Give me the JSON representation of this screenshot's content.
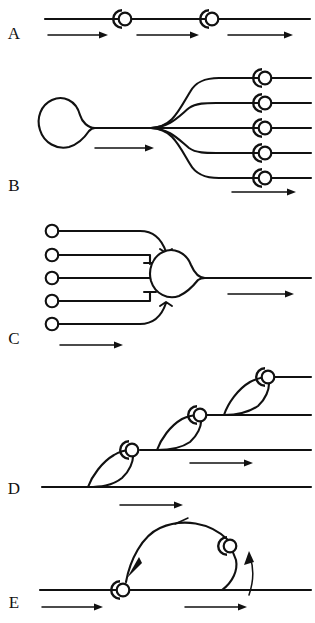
{
  "figure": {
    "title": "",
    "background_color": "#ffffff",
    "ink_color": "#111111",
    "width": 315,
    "height": 623,
    "panel_labels": [
      {
        "id": "A",
        "text": "A",
        "x": 14,
        "y": 39
      },
      {
        "id": "B",
        "text": "B",
        "x": 14,
        "y": 191
      },
      {
        "id": "C",
        "text": "C",
        "x": 14,
        "y": 344
      },
      {
        "id": "D",
        "text": "D",
        "x": 14,
        "y": 494
      },
      {
        "id": "E",
        "text": "E",
        "x": 14,
        "y": 608
      }
    ],
    "panels": [
      {
        "id": "A",
        "label": "A",
        "description": "straight axon with two en-passant node symbols and three rightward flow arrows",
        "baseline_y": 19,
        "axon": {
          "x_start": 45,
          "x_end": 310,
          "y": 19
        },
        "nodes": [
          {
            "cx": 125,
            "cy": 19,
            "r": 7.5
          },
          {
            "cx": 212,
            "cy": 19,
            "r": 7.5
          }
        ],
        "arrows": [
          {
            "x1": 48,
            "y": 35,
            "x2": 105
          },
          {
            "x1": 137,
            "y": 35,
            "x2": 196
          },
          {
            "x1": 228,
            "y": 35,
            "x2": 290
          }
        ]
      },
      {
        "id": "B",
        "label": "B",
        "description": "divergence: one soma tapering into a single axon that branches into five collaterals, each ending at a node symbol",
        "soma": {
          "cx": 70,
          "cy": 125,
          "r": 25
        },
        "trunk": {
          "x_start": 95,
          "x_end": 152,
          "y": 128
        },
        "branch_point": {
          "x": 152,
          "y": 128
        },
        "branches": [
          {
            "y": 78,
            "x_end": 262,
            "node_cx": 265,
            "node_cy": 78,
            "tail_x": 310
          },
          {
            "y": 103,
            "x_end": 262,
            "node_cx": 265,
            "node_cy": 103,
            "tail_x": 310
          },
          {
            "y": 128,
            "x_end": 262,
            "node_cx": 265,
            "node_cy": 128,
            "tail_x": 310
          },
          {
            "y": 153,
            "x_end": 262,
            "node_cx": 265,
            "node_cy": 153,
            "tail_x": 310
          },
          {
            "y": 178,
            "x_end": 262,
            "node_cx": 265,
            "node_cy": 178,
            "tail_x": 310
          }
        ],
        "node_radius": 7.5,
        "arrows": [
          {
            "x1": 95,
            "y": 148,
            "x2": 152
          },
          {
            "x1": 232,
            "y": 192,
            "x2": 294
          }
        ]
      },
      {
        "id": "C",
        "label": "C",
        "description": "convergence: five input fibres with open terminal circles converging on one soma that tapers into a single output axon",
        "inputs": [
          {
            "circle_cx": 52,
            "circle_cy": 231,
            "line_x_end": 148,
            "curve": "top-outer"
          },
          {
            "circle_cx": 52,
            "circle_cy": 255,
            "line_x_end": 157,
            "curve": "top-inner"
          },
          {
            "circle_cx": 52,
            "circle_cy": 278,
            "line_x_end": 150,
            "curve": "straight"
          },
          {
            "circle_cx": 52,
            "circle_cy": 301,
            "line_x_end": 157,
            "curve": "bottom-inner"
          },
          {
            "circle_cx": 52,
            "circle_cy": 324,
            "line_x_end": 148,
            "curve": "bottom-outer"
          }
        ],
        "input_circle_radius": 6.5,
        "soma": {
          "cx": 180,
          "cy": 278,
          "r": 23
        },
        "axon": {
          "x_start": 205,
          "x_end": 310,
          "y": 278
        },
        "arrows": [
          {
            "x1": 60,
            "y": 345,
            "x2": 120
          },
          {
            "x1": 228,
            "y": 294,
            "x2": 292
          }
        ]
      },
      {
        "id": "D",
        "label": "D",
        "description": "ascending cascade of three lens-shaped collateral loops, each terminating at a node symbol on the next higher axon",
        "levels": [
          {
            "y": 487,
            "x_start": 45,
            "x_end": 310
          },
          {
            "y": 447,
            "x_start": 140,
            "x_end": 310
          },
          {
            "y": 412,
            "x_start": 205,
            "x_end": 310
          },
          {
            "y": 375,
            "x_start": 255,
            "x_end": 310
          }
        ],
        "nodes": [
          {
            "cx": 132,
            "cy": 450,
            "r": 7.5
          },
          {
            "cx": 200,
            "cy": 415,
            "r": 7.5
          },
          {
            "cx": 268,
            "cy": 377,
            "r": 7.5
          }
        ],
        "arrows": [
          {
            "x1": 120,
            "y": 505,
            "x2": 180
          },
          {
            "x1": 190,
            "y": 463,
            "x2": 250
          }
        ]
      },
      {
        "id": "E",
        "label": "E",
        "description": "recurrent feedback loop: a long arc from the right node back to the left node with a leftward arrowhead, plus an ascending branch with an upward arrowhead",
        "baseline": {
          "x_start": 40,
          "x_end": 310,
          "y": 590
        },
        "nodes": [
          {
            "cx": 123,
            "cy": 590,
            "r": 7.5,
            "role": "downstream-node"
          },
          {
            "cx": 230,
            "cy": 546,
            "r": 7.5,
            "role": "feedback-node"
          }
        ],
        "feedback_arc": {
          "from_x": 230,
          "from_y": 546,
          "to_x": 123,
          "to_y": 590,
          "direction": "leftward"
        },
        "ascending_branch": {
          "from_x": 222,
          "from_y": 590,
          "to_x": 230,
          "to_y": 546,
          "direction": "upward"
        },
        "arrows": [
          {
            "x1": 42,
            "y": 607,
            "x2": 100
          },
          {
            "x1": 185,
            "y": 607,
            "x2": 248
          }
        ]
      }
    ]
  }
}
